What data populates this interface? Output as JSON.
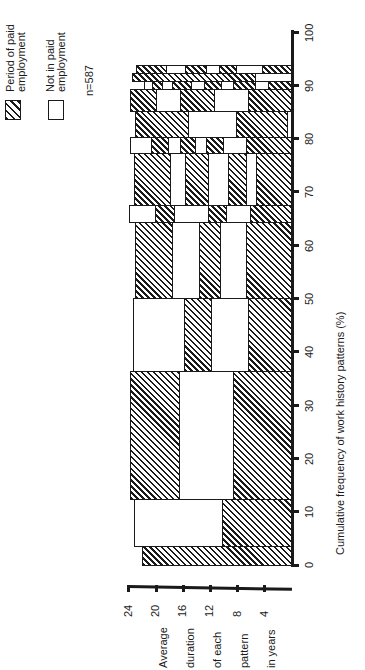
{
  "legend": {
    "paid_label_line1": "Period of paid",
    "paid_label_line2": "employment",
    "unpaid_label_line1": "Not in paid",
    "unpaid_label_line2": "employment",
    "sample_size": "n=587"
  },
  "x_axis": {
    "title": "Cumulative frequency of work history patterns (%)",
    "ticks": [
      "0",
      "10",
      "20",
      "30",
      "40",
      "50",
      "60",
      "70",
      "80",
      "90",
      "100"
    ]
  },
  "y_axis": {
    "title_lines": [
      "Average",
      "duration",
      "of each",
      "pattern",
      "in years"
    ],
    "ticks": [
      "24",
      "20",
      "16",
      "12",
      "8",
      "4"
    ]
  },
  "chart_data": {
    "type": "bar",
    "subtype": "variable-width stacked bar (mosaic), rotated 90 degrees",
    "title": "",
    "xlabel": "Cumulative frequency of work history patterns (%)",
    "ylabel": "Average duration of each pattern in years",
    "xlim": [
      0,
      100
    ],
    "ylim": [
      0,
      24
    ],
    "legend": [
      {
        "key": "P",
        "label": "Period of paid employment",
        "fill": "hatched"
      },
      {
        "key": "N",
        "label": "Not in paid employment",
        "fill": "white"
      }
    ],
    "annotation": "n=587",
    "grid": false,
    "note": "Each pattern spans a range of cumulative %; segments listed from start of working life (duration axis origin) outward, in years.",
    "patterns": [
      {
        "pct": [
          0.0,
          3.6
        ],
        "segments": [
          [
            "P",
            22.1
          ]
        ]
      },
      {
        "pct": [
          3.6,
          12.4
        ],
        "segments": [
          [
            "P",
            10.3
          ],
          [
            "N",
            12.9
          ]
        ]
      },
      {
        "pct": [
          12.4,
          36.4
        ],
        "segments": [
          [
            "P",
            8.7
          ],
          [
            "N",
            7.9
          ],
          [
            "P",
            7.2
          ]
        ]
      },
      {
        "pct": [
          36.4,
          50.1
        ],
        "segments": [
          [
            "P",
            6.5
          ],
          [
            "N",
            5.4
          ],
          [
            "P",
            4.0
          ],
          [
            "N",
            7.5
          ]
        ]
      },
      {
        "pct": [
          50.1,
          64.4
        ],
        "segments": [
          [
            "P",
            6.8
          ],
          [
            "N",
            3.8
          ],
          [
            "P",
            3.1
          ],
          [
            "N",
            4.0
          ],
          [
            "P",
            5.4
          ]
        ]
      },
      {
        "pct": [
          64.4,
          67.5
        ],
        "segments": [
          [
            "P",
            6.2
          ],
          [
            "N",
            3.5
          ],
          [
            "P",
            2.6
          ],
          [
            "N",
            5.1
          ],
          [
            "P",
            2.8
          ],
          [
            "N",
            3.8
          ]
        ]
      },
      {
        "pct": [
          67.5,
          77.3
        ],
        "segments": [
          [
            "P",
            5.3
          ],
          [
            "N",
            1.5
          ],
          [
            "P",
            2.6
          ],
          [
            "N",
            2.9
          ],
          [
            "P",
            3.5
          ],
          [
            "N",
            2.1
          ],
          [
            "P",
            5.3
          ]
        ]
      },
      {
        "pct": [
          77.3,
          80.3
        ],
        "segments": [
          [
            "P",
            6.8
          ],
          [
            "N",
            3.4
          ],
          [
            "P",
            2.4
          ],
          [
            "N",
            1.6
          ],
          [
            "P",
            2.2
          ],
          [
            "N",
            1.9
          ],
          [
            "P",
            2.4
          ],
          [
            "N",
            3.1
          ]
        ]
      },
      {
        "pct": [
          80.3,
          85.2
        ],
        "segments": [
          [
            "N",
            0.7
          ],
          [
            "P",
            7.5
          ],
          [
            "N",
            7.1
          ],
          [
            "P",
            7.8
          ]
        ]
      },
      {
        "pct": [
          85.2,
          89.3
        ],
        "segments": [
          [
            "P",
            6.5
          ],
          [
            "N",
            5.0
          ],
          [
            "P",
            5.0
          ],
          [
            "N",
            3.5
          ],
          [
            "P",
            3.8
          ]
        ]
      },
      {
        "pct": [
          89.3,
          90.8
        ],
        "segments": [
          [
            "P",
            3.5
          ],
          [
            "N",
            2.0
          ],
          [
            "P",
            3.2
          ],
          [
            "N",
            1.8
          ],
          [
            "P",
            2.5
          ],
          [
            "N",
            1.8
          ],
          [
            "P",
            2.8
          ],
          [
            "N",
            1.5
          ],
          [
            "P",
            1.5
          ],
          [
            "N",
            1.2
          ]
        ]
      },
      {
        "pct": [
          90.8,
          92.3
        ],
        "segments": [
          [
            "N",
            5.4
          ],
          [
            "P",
            18.1
          ]
        ]
      },
      {
        "pct": [
          92.3,
          93.8
        ],
        "segments": [
          [
            "P",
            4.4
          ],
          [
            "N",
            3.8
          ],
          [
            "P",
            2.6
          ],
          [
            "N",
            1.8
          ],
          [
            "P",
            3.1
          ],
          [
            "N",
            2.9
          ],
          [
            "P",
            4.4
          ]
        ]
      }
    ]
  }
}
